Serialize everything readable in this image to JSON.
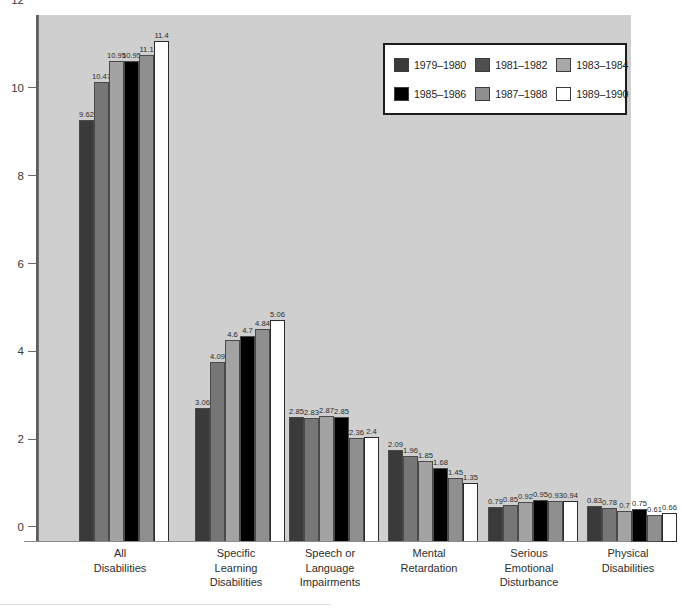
{
  "chart_data": {
    "type": "bar",
    "title": "",
    "subtitle": "",
    "xlabel": "",
    "ylabel": "",
    "ylim": [
      0,
      12
    ],
    "yticks": [
      "0",
      "2",
      "4",
      "6",
      "8",
      "10",
      "12"
    ],
    "grid": false,
    "legend_position": "top-right",
    "categories": [
      "All\nDisabilities",
      "Specific\nLearning\nDisabilities",
      "Speech or\nLanguage\nImpairments",
      "Mental\nRetardation",
      "Serious\nEmotional\nDisturbance",
      "Physical\nDisabilities"
    ],
    "category_lines": [
      [
        "All",
        "Disabilities"
      ],
      [
        "Specific",
        "Learning",
        "Disabilities"
      ],
      [
        "Speech or",
        "Language",
        "Impairments"
      ],
      [
        "Mental",
        "Retardation"
      ],
      [
        "Serious",
        "Emotional",
        "Disturbance"
      ],
      [
        "Physical",
        "Disabilities"
      ]
    ],
    "series": [
      {
        "name": "1979–1980",
        "color": "#3a3a3a",
        "values": [
          9.62,
          3.06,
          2.85,
          2.09,
          0.79,
          0.83
        ],
        "labels": [
          "9.62",
          "3.06",
          "2.85",
          "2.09",
          "0.79",
          "0.83"
        ]
      },
      {
        "name": "1981–1982",
        "color": "#767676",
        "values": [
          10.47,
          4.09,
          2.83,
          1.96,
          0.85,
          0.78
        ],
        "labels": [
          "10.47",
          "4.09",
          "2.83",
          "1.96",
          "0.85",
          "0.78"
        ]
      },
      {
        "name": "1983–1984",
        "color": "#a3a3a3",
        "values": [
          10.95,
          4.6,
          2.87,
          1.85,
          0.92,
          0.7
        ],
        "labels": [
          "10.95",
          "4.6",
          "2.87",
          "1.85",
          "0.92",
          "0.7"
        ]
      },
      {
        "name": "1985–1986",
        "color": "#000000",
        "values": [
          10.95,
          4.7,
          2.85,
          1.68,
          0.95,
          0.75
        ],
        "labels": [
          "10.95",
          "4.7",
          "2.85",
          "1.68",
          "0.95",
          "0.75"
        ]
      },
      {
        "name": "1987–1988",
        "color": "#8f8f8f",
        "values": [
          11.1,
          4.84,
          2.36,
          1.45,
          0.93,
          0.61
        ],
        "labels": [
          "11.1",
          "4.84",
          "2.36",
          "1.45",
          "0.93",
          "0.61"
        ]
      },
      {
        "name": "1989–1990",
        "color": "#ffffff",
        "values": [
          11.4,
          5.06,
          2.4,
          1.35,
          0.94,
          0.66
        ],
        "labels": [
          "11.4",
          "5.06",
          "2.4",
          "1.35",
          "0.94",
          "0.66"
        ]
      }
    ]
  },
  "legend": {
    "items": [
      {
        "label": "1979–1980",
        "color": "#3a3a3a"
      },
      {
        "label": "1981–1982",
        "color": "#505050"
      },
      {
        "label": "1983–1984",
        "color": "#a8a8a8"
      },
      {
        "label": "1985–1986",
        "color": "#000000"
      },
      {
        "label": "1987–1988",
        "color": "#8f8f8f"
      },
      {
        "label": "1989–1990",
        "color": "#ffffff"
      }
    ]
  },
  "axis": {
    "y_ticks": [
      "12",
      "10",
      "8",
      "6",
      "4",
      "2",
      "0"
    ]
  },
  "colors": {
    "plot_background": "#cfcfcf",
    "page_background": "#ffffff",
    "axis": "#5e5e5e",
    "text": "#2e2e2e"
  }
}
